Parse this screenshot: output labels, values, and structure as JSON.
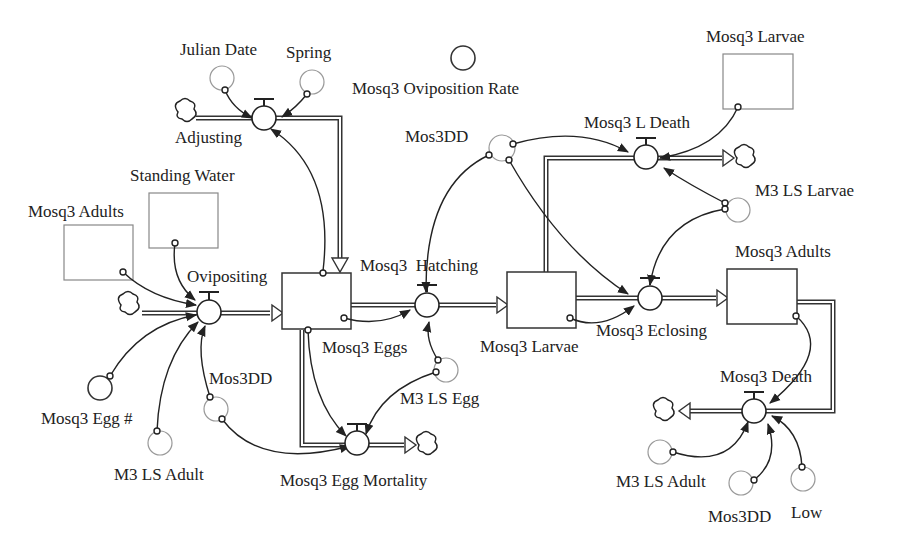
{
  "diagram": {
    "type": "stock-and-flow",
    "stocks": [
      {
        "id": "eggs",
        "label": "Mosq3 Eggs"
      },
      {
        "id": "larvae",
        "label": "Mosq3 Larvae"
      },
      {
        "id": "adults",
        "label": "Mosq3 Adults"
      },
      {
        "id": "ghost_adults",
        "label": "Mosq3 Adults"
      },
      {
        "id": "ghost_water",
        "label": "Standing Water"
      },
      {
        "id": "ghost_larvae",
        "label": "Mosq3 Larvae"
      }
    ],
    "flows": [
      {
        "id": "adjusting",
        "label": "Adjusting"
      },
      {
        "id": "ovipositing",
        "label": "Ovipositing"
      },
      {
        "id": "hatching",
        "label": "Mosq3  Hatching"
      },
      {
        "id": "egg_mortality",
        "label": "Mosq3 Egg Mortality"
      },
      {
        "id": "l_death",
        "label": "Mosq3 L Death"
      },
      {
        "id": "eclosing",
        "label": "Mosq3 Eclosing"
      },
      {
        "id": "death",
        "label": "Mosq3 Death"
      }
    ],
    "converters": [
      {
        "id": "julian",
        "label": "Julian Date"
      },
      {
        "id": "spring",
        "label": "Spring"
      },
      {
        "id": "ovip_rate",
        "label": "Mosq3 Oviposition Rate"
      },
      {
        "id": "mos3dd_top",
        "label": "Mos3DD"
      },
      {
        "id": "m3ls_larvae",
        "label": "M3 LS Larvae"
      },
      {
        "id": "egg_num",
        "label": "Mosq3 Egg #"
      },
      {
        "id": "m3ls_adult_left",
        "label": "M3 LS Adult"
      },
      {
        "id": "mos3dd_left",
        "label": "Mos3DD"
      },
      {
        "id": "m3ls_egg",
        "label": "M3 LS Egg"
      },
      {
        "id": "m3ls_adult_right",
        "label": "M3 LS Adult"
      },
      {
        "id": "mos3dd_right",
        "label": "Mos3DD"
      },
      {
        "id": "low",
        "label": "Low"
      }
    ]
  }
}
